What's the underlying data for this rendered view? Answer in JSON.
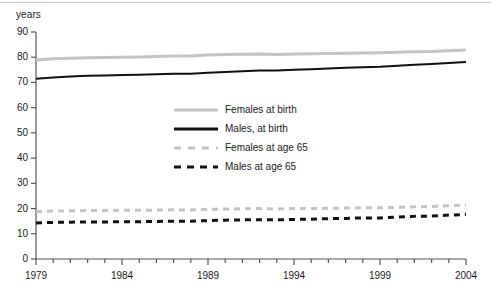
{
  "chart_data": {
    "type": "line",
    "title": "",
    "xlabel": "",
    "ylabel": "years",
    "ylim": [
      0,
      90
    ],
    "xlim": [
      1979,
      2004
    ],
    "ytick_labels": [
      "90",
      "80",
      "70",
      "60",
      "50",
      "40",
      "30",
      "20",
      "10",
      "0"
    ],
    "ytick_values": [
      90,
      80,
      70,
      60,
      50,
      40,
      30,
      20,
      10,
      0
    ],
    "xtick_labels": [
      "1979",
      "1984",
      "1989",
      "1994",
      "1999",
      "2004"
    ],
    "xtick_values": [
      1979,
      1984,
      1989,
      1994,
      1999,
      2004
    ],
    "grid": false,
    "legend_position": "center-left-inside",
    "x": [
      1979,
      1980,
      1981,
      1982,
      1983,
      1984,
      1985,
      1986,
      1987,
      1988,
      1989,
      1990,
      1991,
      1992,
      1993,
      1994,
      1995,
      1996,
      1997,
      1998,
      1999,
      2000,
      2001,
      2002,
      2003,
      2004
    ],
    "series": [
      {
        "name": "Females at birth",
        "color": "#c4c4c4",
        "style": "solid",
        "width": 3,
        "values": [
          78.9,
          79.4,
          79.6,
          79.8,
          79.9,
          80.0,
          80.1,
          80.3,
          80.5,
          80.5,
          80.9,
          81.1,
          81.2,
          81.3,
          81.1,
          81.3,
          81.4,
          81.5,
          81.6,
          81.7,
          81.8,
          82.0,
          82.2,
          82.3,
          82.6,
          82.9
        ],
        "start_value": 78.9,
        "end_value": 82.9
      },
      {
        "name": "Males, at birth",
        "color": "#111111",
        "style": "solid",
        "width": 2,
        "values": [
          71.5,
          72.0,
          72.4,
          72.7,
          72.8,
          73.0,
          73.1,
          73.2,
          73.4,
          73.4,
          73.8,
          74.1,
          74.4,
          74.7,
          74.7,
          75.0,
          75.2,
          75.5,
          75.8,
          76.0,
          76.2,
          76.6,
          77.0,
          77.3,
          77.7,
          78.1
        ],
        "start_value": 71.5,
        "end_value": 78.1
      },
      {
        "name": "Females at age 65",
        "color": "#c4c4c4",
        "style": "dashed",
        "width": 3,
        "values": [
          18.8,
          19.0,
          19.1,
          19.2,
          19.2,
          19.3,
          19.3,
          19.4,
          19.5,
          19.4,
          19.7,
          19.8,
          19.9,
          20.0,
          19.8,
          20.0,
          20.0,
          20.1,
          20.2,
          20.3,
          20.3,
          20.5,
          20.7,
          20.8,
          21.1,
          21.4
        ],
        "start_value": 18.8,
        "end_value": 21.4
      },
      {
        "name": "Males at age 65",
        "color": "#111111",
        "style": "dashed",
        "width": 3,
        "values": [
          14.3,
          14.5,
          14.6,
          14.7,
          14.7,
          14.8,
          14.8,
          14.9,
          15.0,
          15.0,
          15.2,
          15.4,
          15.5,
          15.6,
          15.5,
          15.7,
          15.8,
          16.0,
          16.1,
          16.3,
          16.3,
          16.6,
          16.9,
          17.0,
          17.4,
          17.7
        ],
        "start_value": 14.3,
        "end_value": 17.7
      }
    ]
  },
  "axis": {
    "unit_label": "years"
  },
  "legend": {
    "items": [
      {
        "label": "Females at birth",
        "swatch": "sw-solid-gray"
      },
      {
        "label": "Males, at birth",
        "swatch": "sw-solid-black"
      },
      {
        "label": "Females at age 65",
        "swatch": "sw-dash-gray"
      },
      {
        "label": "Males at age 65",
        "swatch": "sw-dash-black"
      }
    ]
  }
}
